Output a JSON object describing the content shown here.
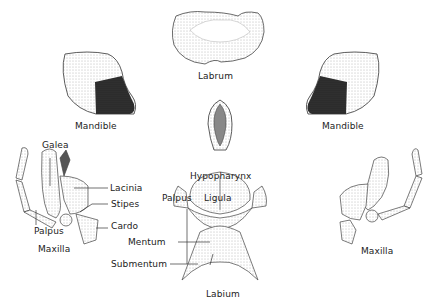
{
  "diagram": {
    "parts": {
      "labrum": {
        "label": "Labrum"
      },
      "mandible_left": {
        "label": "Mandible"
      },
      "mandible_right": {
        "label": "Mandible"
      },
      "hypopharynx": {
        "label": "Hypopharynx"
      },
      "maxilla_left": {
        "label": "Maxilla",
        "callouts": [
          "Galea",
          "Lacinia",
          "Stipes",
          "Cardo",
          "Palpus"
        ]
      },
      "maxilla_right": {
        "label": "Maxilla"
      },
      "labium": {
        "label": "Labium",
        "callouts": [
          "Palpus",
          "Ligula",
          "Mentum",
          "Submentum"
        ]
      }
    }
  }
}
